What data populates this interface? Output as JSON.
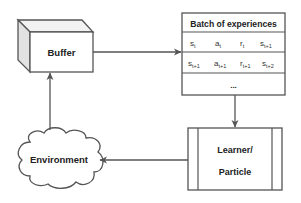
{
  "diagram": {
    "nodes": {
      "buffer": {
        "label": "Buffer"
      },
      "batch": {
        "title": "Batch of experiences",
        "rows": [
          [
            {
              "base": "s",
              "sub": "t"
            },
            {
              "base": "a",
              "sub": "t"
            },
            {
              "base": "r",
              "sub": "t"
            },
            {
              "base": "s",
              "sub": "t+1"
            }
          ],
          [
            {
              "base": "s",
              "sub": "t+1"
            },
            {
              "base": "a",
              "sub": "t+1"
            },
            {
              "base": "r",
              "sub": "t+1"
            },
            {
              "base": "s",
              "sub": "t+2"
            }
          ]
        ],
        "ellipsis": "..."
      },
      "learner": {
        "line1": "Learner/",
        "line2": "Particle"
      },
      "environment": {
        "label": "Environment"
      }
    },
    "edges": [
      {
        "from": "buffer",
        "to": "batch"
      },
      {
        "from": "batch",
        "to": "learner"
      },
      {
        "from": "learner",
        "to": "environment"
      },
      {
        "from": "environment",
        "to": "buffer"
      }
    ],
    "colors": {
      "stroke": "#555555",
      "fill": "#ffffff",
      "shade": "#e6e6e6",
      "text": "#222222"
    }
  }
}
